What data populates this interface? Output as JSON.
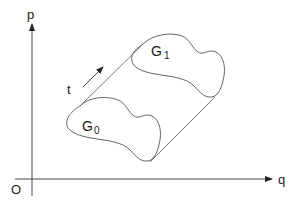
{
  "diagram": {
    "axes": {
      "vertical_label": "p",
      "horizontal_label": "q",
      "origin_label": "O"
    },
    "flow": {
      "direction_label": "t"
    },
    "regions": [
      {
        "name": "G",
        "subscript": "0"
      },
      {
        "name": "G",
        "subscript": "1"
      }
    ],
    "colors": {
      "stroke": "#555555",
      "axis": "#333333",
      "text": "#1a1a1a",
      "background": "#ffffff"
    }
  }
}
